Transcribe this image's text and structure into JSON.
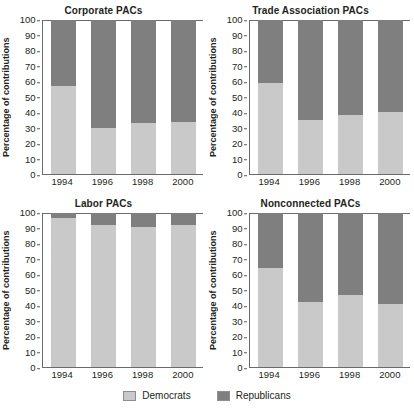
{
  "top_fragment": "",
  "axis": {
    "ylabel": "Percentage of contributions",
    "yticks": [
      "100",
      "90",
      "80",
      "70",
      "60",
      "50",
      "40",
      "30",
      "20",
      "10",
      "0"
    ],
    "xticks": [
      "1994",
      "1996",
      "1998",
      "2000"
    ]
  },
  "legend": {
    "items": [
      {
        "label": "Democrats",
        "color": "#c9c9c9"
      },
      {
        "label": "Republicans",
        "color": "#7f7f7f"
      }
    ]
  },
  "chart_data": [
    {
      "type": "bar",
      "title": "Corporate PACs",
      "xlabel": "",
      "ylabel": "Percentage of contributions",
      "ylim": [
        0,
        100
      ],
      "grid": false,
      "stacked": true,
      "legend_position": "bottom",
      "categories": [
        "1994",
        "1996",
        "1998",
        "2000"
      ],
      "series": [
        {
          "name": "Democrats",
          "color": "#c9c9c9",
          "values": [
            57,
            30,
            33,
            34
          ]
        },
        {
          "name": "Republicans",
          "color": "#7f7f7f",
          "values": [
            43,
            70,
            67,
            66
          ]
        }
      ]
    },
    {
      "type": "bar",
      "title": "Trade Association PACs",
      "xlabel": "",
      "ylabel": "Percentage of contributions",
      "ylim": [
        0,
        100
      ],
      "grid": false,
      "stacked": true,
      "legend_position": "bottom",
      "categories": [
        "1994",
        "1996",
        "1998",
        "2000"
      ],
      "series": [
        {
          "name": "Democrats",
          "color": "#c9c9c9",
          "values": [
            59,
            35,
            38,
            40
          ]
        },
        {
          "name": "Republicans",
          "color": "#7f7f7f",
          "values": [
            41,
            65,
            62,
            60
          ]
        }
      ]
    },
    {
      "type": "bar",
      "title": "Labor PACs",
      "xlabel": "",
      "ylabel": "Percentage of contributions",
      "ylim": [
        0,
        100
      ],
      "grid": false,
      "stacked": true,
      "legend_position": "bottom",
      "categories": [
        "1994",
        "1996",
        "1998",
        "2000"
      ],
      "series": [
        {
          "name": "Democrats",
          "color": "#c9c9c9",
          "values": [
            97,
            92,
            91,
            92
          ]
        },
        {
          "name": "Republicans",
          "color": "#7f7f7f",
          "values": [
            3,
            8,
            9,
            8
          ]
        }
      ]
    },
    {
      "type": "bar",
      "title": "Nonconnected PACs",
      "xlabel": "",
      "ylabel": "Percentage of contributions",
      "ylim": [
        0,
        100
      ],
      "grid": false,
      "stacked": true,
      "legend_position": "bottom",
      "categories": [
        "1994",
        "1996",
        "1998",
        "2000"
      ],
      "series": [
        {
          "name": "Democrats",
          "color": "#c9c9c9",
          "values": [
            64,
            42,
            47,
            41
          ]
        },
        {
          "name": "Republicans",
          "color": "#7f7f7f",
          "values": [
            36,
            58,
            53,
            59
          ]
        }
      ]
    }
  ]
}
